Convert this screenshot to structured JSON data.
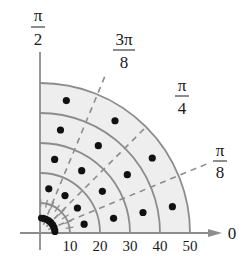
{
  "diagram": {
    "type": "polar-sector-plot",
    "origin_px": [
      40,
      233
    ],
    "px_per_unit": 3,
    "colors": {
      "fill": "#eeeeee",
      "arc": "#8c8c8c",
      "axis": "#8c8c8c",
      "dash": "#8c8c8c",
      "dot": "#111111",
      "text": "#1a1a1a"
    },
    "radii": [
      10,
      20,
      30,
      40,
      50
    ],
    "radial_tick_labels": [
      "10",
      "20",
      "30",
      "40",
      "50"
    ],
    "angle_labels": [
      {
        "name": "zero",
        "numerator": "0",
        "denominator": "",
        "angle_deg": 0
      },
      {
        "name": "pi-over-8",
        "numerator": "π",
        "denominator": "8",
        "angle_deg": 22.5
      },
      {
        "name": "pi-over-4",
        "numerator": "π",
        "denominator": "4",
        "angle_deg": 45
      },
      {
        "name": "3pi-over-8",
        "numerator": "3π",
        "denominator": "8",
        "angle_deg": 67.5
      },
      {
        "name": "pi-over-2",
        "numerator": "π",
        "denominator": "2",
        "angle_deg": 90
      }
    ],
    "dashed_rays_deg": [
      22.5,
      45,
      67.5
    ],
    "dots": [
      {
        "r": 15,
        "theta_deg": 11.25
      },
      {
        "r": 25,
        "theta_deg": 11.25
      },
      {
        "r": 35,
        "theta_deg": 11.25
      },
      {
        "r": 45,
        "theta_deg": 11.25
      },
      {
        "r": 15,
        "theta_deg": 33.75
      },
      {
        "r": 25,
        "theta_deg": 33.75
      },
      {
        "r": 35,
        "theta_deg": 33.75
      },
      {
        "r": 45,
        "theta_deg": 33.75
      },
      {
        "r": 15,
        "theta_deg": 56.25
      },
      {
        "r": 25,
        "theta_deg": 56.25
      },
      {
        "r": 35,
        "theta_deg": 56.25
      },
      {
        "r": 45,
        "theta_deg": 56.25
      },
      {
        "r": 15,
        "theta_deg": 78.75
      },
      {
        "r": 25,
        "theta_deg": 78.75
      },
      {
        "r": 35,
        "theta_deg": 78.75
      },
      {
        "r": 45,
        "theta_deg": 78.75
      }
    ],
    "origin_cluster": {
      "r": 5,
      "theta_from_deg": 5,
      "theta_to_deg": 85,
      "count": 12
    }
  }
}
